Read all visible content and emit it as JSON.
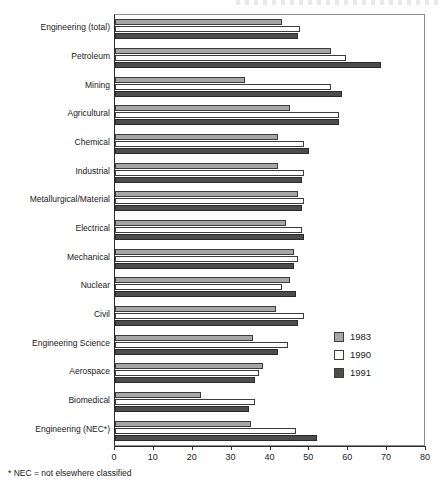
{
  "footnote": "* NEC = not elsewhere classified",
  "legend": {
    "position": "inside-right",
    "items": [
      {
        "label": "1983",
        "swatch": "light-gray",
        "color": "#a6a6a6"
      },
      {
        "label": "1990",
        "swatch": "white",
        "color": "#ffffff"
      },
      {
        "label": "1991",
        "swatch": "dark-gray",
        "color": "#4d4d4d"
      }
    ]
  },
  "chart_data": {
    "type": "bar",
    "orientation": "horizontal",
    "title": "",
    "xlabel": "",
    "ylabel": "",
    "xlim": [
      0,
      80
    ],
    "xticks": [
      0,
      10,
      20,
      30,
      40,
      50,
      60,
      70,
      80
    ],
    "xticklabels": [
      "0",
      "10",
      "20",
      "30",
      "40",
      "50",
      "60",
      "70",
      "80"
    ],
    "grid": false,
    "legend_position": "inside-right",
    "categories": [
      "Engineering (total)",
      "Petroleum",
      "Mining",
      "Agricultural",
      "Chemical",
      "Industrial",
      "Metallurgical/Material",
      "Electrical",
      "Mechanical",
      "Nuclear",
      "Civil",
      "Engineering Science",
      "Aerospace",
      "Biomedical",
      "Engineering (NEC*)"
    ],
    "series": [
      {
        "name": "1983",
        "color": "#a6a6a6",
        "values": [
          43,
          55.5,
          33.5,
          45,
          42,
          42,
          47,
          44,
          46,
          45,
          41.5,
          35.5,
          38,
          22,
          35
        ]
      },
      {
        "name": "1990",
        "color": "#ffffff",
        "values": [
          47.5,
          59.5,
          55.5,
          57.5,
          48.5,
          48.5,
          48.5,
          48,
          47,
          43,
          48.5,
          44.5,
          37,
          36,
          46.5
        ]
      },
      {
        "name": "1991",
        "color": "#4d4d4d",
        "values": [
          47,
          68.5,
          58.5,
          57.5,
          50,
          48,
          48,
          48.5,
          46,
          46.5,
          47,
          42,
          36,
          34.5,
          52
        ]
      }
    ]
  }
}
